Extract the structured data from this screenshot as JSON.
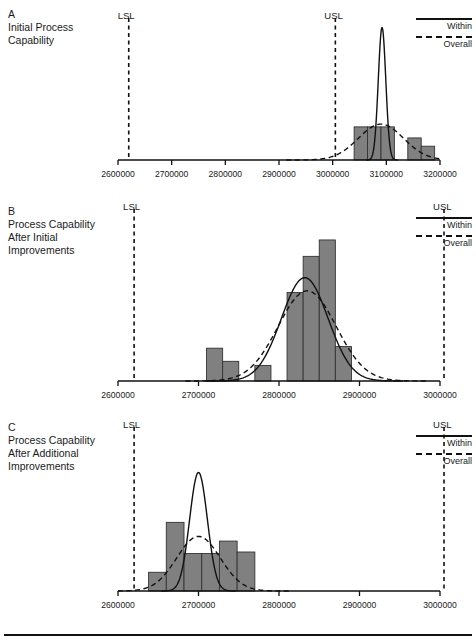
{
  "figure": {
    "legend": {
      "within_label": "Within",
      "overall_label": "Overall",
      "within_style": "solid-line",
      "overall_style": "dashed-line"
    },
    "limit_labels": {
      "lsl": "LSL",
      "usl": "USL"
    },
    "colors": {
      "bar_fill": "#808080",
      "bar_stroke": "#333333",
      "curve": "#111111",
      "axis": "#111111",
      "text": "#1a1a1a"
    }
  },
  "panels": [
    {
      "letter": "A",
      "title_lines": [
        "Initial Process",
        "Capability"
      ],
      "lsl_value": 2620000,
      "usl_value": 3005000,
      "chart_data": {
        "type": "bar",
        "title": "Initial Process Capability",
        "xlabel": "",
        "ylabel": "",
        "xlim": [
          2600000,
          3200000
        ],
        "ylim": [
          0,
          10
        ],
        "grid": false,
        "legend": [
          "Within",
          "Overall"
        ],
        "tick_labels": [
          "2600000",
          "2700000",
          "2800000",
          "2900000",
          "3000000",
          "3100000",
          "3200000"
        ],
        "ticks": [
          2600000,
          2700000,
          2800000,
          2900000,
          3000000,
          3100000,
          3200000
        ],
        "bin_edges": [
          3040000,
          3065000,
          3090000,
          3115000,
          3140000,
          3165000,
          3190000
        ],
        "values": [
          2.4,
          2.4,
          2.4,
          0,
          1.6,
          1.0,
          0.45
        ],
        "annotations": [
          "LSL",
          "USL"
        ],
        "curves": [
          {
            "name": "Within",
            "style": "solid",
            "mean": 3092000,
            "sd": 7000,
            "peak": 9.6
          },
          {
            "name": "Overall",
            "style": "dashed",
            "mean": 3090000,
            "sd": 42000,
            "peak": 2.6
          }
        ]
      }
    },
    {
      "letter": "B",
      "title_lines": [
        "Process Capability",
        "After Initial",
        "Improvements"
      ],
      "lsl_value": 2620000,
      "usl_value": 3005000,
      "chart_data": {
        "type": "bar",
        "title": "Process Capability After Initial Improvements",
        "xlabel": "",
        "ylabel": "",
        "xlim": [
          2600000,
          3000000
        ],
        "ylim": [
          0,
          10
        ],
        "grid": false,
        "legend": [
          "Within",
          "Overall"
        ],
        "tick_labels": [
          "2600000",
          "2700000",
          "2800000",
          "2900000",
          "3000000"
        ],
        "ticks": [
          2600000,
          2700000,
          2800000,
          2900000,
          3000000
        ],
        "bin_edges": [
          2710000,
          2730000,
          2750000,
          2770000,
          2790000,
          2810000,
          2830000,
          2850000,
          2870000,
          2890000
        ],
        "values": [
          2.0,
          1.2,
          0,
          0.95,
          0,
          5.4,
          7.6,
          8.6,
          2.1
        ],
        "annotations": [
          "LSL",
          "USL"
        ],
        "curves": [
          {
            "name": "Within",
            "style": "solid",
            "mean": 2832000,
            "sd": 29000,
            "peak": 6.3
          },
          {
            "name": "Overall",
            "style": "dashed",
            "mean": 2835000,
            "sd": 36000,
            "peak": 5.5
          }
        ]
      }
    },
    {
      "letter": "C",
      "title_lines": [
        "Process Capability",
        "After Additional",
        "Improvements"
      ],
      "lsl_value": 2620000,
      "usl_value": 3005000,
      "chart_data": {
        "type": "bar",
        "title": "Process Capability After Additional Improvements",
        "xlabel": "",
        "ylabel": "",
        "xlim": [
          2600000,
          3000000
        ],
        "ylim": [
          0,
          10
        ],
        "grid": false,
        "legend": [
          "Within",
          "Overall"
        ],
        "tick_labels": [
          "2600000",
          "2700000",
          "2800000",
          "2900000",
          "3000000"
        ],
        "ticks": [
          2600000,
          2700000,
          2800000,
          2900000,
          3000000
        ],
        "bin_edges": [
          2638000,
          2660000,
          2682000,
          2704000,
          2726000,
          2748000,
          2770000
        ],
        "values": [
          1.2,
          4.4,
          2.4,
          2.4,
          3.2,
          2.5
        ],
        "annotations": [
          "LSL",
          "USL"
        ],
        "curves": [
          {
            "name": "Within",
            "style": "solid",
            "mean": 2700000,
            "sd": 11000,
            "peak": 7.6
          },
          {
            "name": "Overall",
            "style": "dashed",
            "mean": 2700000,
            "sd": 27000,
            "peak": 3.5
          }
        ]
      }
    }
  ]
}
